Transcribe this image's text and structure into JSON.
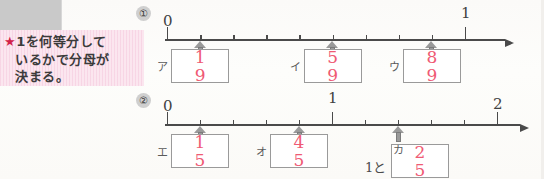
{
  "worksheet": {
    "note": {
      "star_icon": "★",
      "line1": "1を何等分して",
      "line2": "いるかで分母が",
      "line3": "決まる。",
      "background_color": "#fbe6ef"
    },
    "accent_color": "#ef5a74",
    "line_color": "#4a4a4a",
    "problems": [
      {
        "number": "①",
        "number_plain": "1",
        "start_label": "0",
        "end_label": "1",
        "divisions": 9,
        "markers": [
          {
            "kana": "ア",
            "numerator": "1",
            "denominator": "9",
            "position": 1
          },
          {
            "kana": "イ",
            "numerator": "5",
            "denominator": "9",
            "position": 5
          },
          {
            "kana": "ウ",
            "numerator": "8",
            "denominator": "9",
            "position": 8
          }
        ]
      },
      {
        "number": "②",
        "number_plain": "2",
        "start_label": "0",
        "mid_label": "1",
        "end_label": "2",
        "divisions": 10,
        "markers": [
          {
            "kana": "エ",
            "numerator": "1",
            "denominator": "5",
            "position": 1
          },
          {
            "kana": "オ",
            "numerator": "4",
            "denominator": "5",
            "position": 4
          },
          {
            "kana": "カ",
            "numerator": "2",
            "denominator": "5",
            "position": 7,
            "whole_prefix": "1と"
          }
        ]
      }
    ]
  }
}
